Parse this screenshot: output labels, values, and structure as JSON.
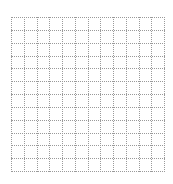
{
  "title": "",
  "grid": {
    "columns": 12,
    "rows": 12,
    "line_style": "dotted",
    "line_color": "#9a9a9a",
    "background": "#ffffff"
  }
}
